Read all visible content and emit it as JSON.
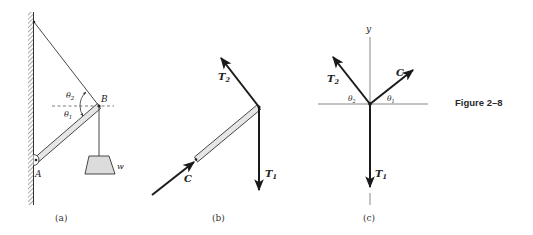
{
  "figure": {
    "caption": "Figure 2–8",
    "colors": {
      "ink": "#1a1a1a",
      "thin_line": "#555555",
      "rod_fill": "#e6e6e6",
      "weight_fill": "#dcdcdc",
      "background": "#ffffff"
    }
  },
  "panels": [
    {
      "id": "a",
      "label": "(a)",
      "description": "Boom AB pinned to wall at A, supported by cable from wall to B, weight w hanging from B",
      "points": {
        "A": "A",
        "B": "B"
      },
      "angles": {
        "theta1": "θ",
        "theta1_sub": "1",
        "theta2": "θ",
        "theta2_sub": "2"
      },
      "weight_label": "w"
    },
    {
      "id": "b",
      "label": "(b)",
      "description": "Free-body diagram of boom with forces T2, T1 and C",
      "forces": {
        "T2": {
          "main": "T",
          "sub": "2"
        },
        "T1": {
          "main": "T",
          "sub": "1"
        },
        "C": {
          "main": "C"
        }
      }
    },
    {
      "id": "c",
      "label": "(c)",
      "description": "Concurrent force system at B on x-y axes",
      "axis_label": "y",
      "forces": {
        "T2": {
          "main": "T",
          "sub": "2"
        },
        "T1": {
          "main": "T",
          "sub": "1"
        },
        "C": {
          "main": "C"
        }
      },
      "angles": {
        "theta1": "θ",
        "theta1_sub": "1",
        "theta2": "θ",
        "theta2_sub": "2"
      }
    }
  ]
}
